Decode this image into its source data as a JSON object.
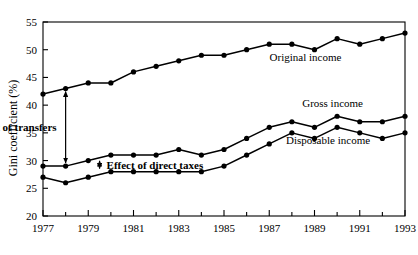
{
  "chart_data": {
    "type": "line",
    "title": "",
    "xlabel": "",
    "ylabel": "Gini coefficient (%)",
    "x": [
      1977,
      1978,
      1979,
      1980,
      1981,
      1982,
      1983,
      1984,
      1985,
      1986,
      1987,
      1988,
      1989,
      1990,
      1991,
      1992,
      1993
    ],
    "xlim": [
      1977,
      1993
    ],
    "ylim": [
      20,
      55
    ],
    "yticks": [
      20,
      25,
      30,
      35,
      40,
      45,
      50,
      55
    ],
    "xticks": [
      1977,
      1979,
      1981,
      1983,
      1985,
      1987,
      1989,
      1991,
      1993
    ],
    "xtick_labels": [
      "1977",
      "1979",
      "1981",
      "1983",
      "1985",
      "1987",
      "1989",
      "1991",
      "1993"
    ],
    "ytick_labels": [
      "20",
      "25",
      "30",
      "35",
      "40",
      "45",
      "50",
      "55"
    ],
    "grid": false,
    "legend_position": "inline-labels",
    "marker": "filled-circle",
    "line_color": "#000000",
    "series": [
      {
        "name": "Original income",
        "values": [
          42,
          43,
          44,
          44,
          46,
          47,
          48,
          49,
          49,
          50,
          51,
          51,
          50,
          52,
          51,
          52,
          53
        ]
      },
      {
        "name": "Gross income",
        "values": [
          29,
          29,
          30,
          31,
          31,
          31,
          32,
          31,
          32,
          34,
          36,
          37,
          36,
          38,
          37,
          37,
          38
        ]
      },
      {
        "name": "Disposable income",
        "values": [
          27,
          26,
          27,
          28,
          28,
          28,
          28,
          28,
          29,
          31,
          33,
          35,
          34,
          36,
          35,
          34,
          35
        ]
      }
    ],
    "annotations": [
      {
        "text": "Effect of transfers",
        "kind": "double-arrow",
        "at_x": 1978,
        "from_y": 43,
        "to_y": 29
      },
      {
        "text": "Effect of direct taxes",
        "kind": "double-arrow",
        "at_x": 1979.5,
        "from_y": 30.5,
        "to_y": 28
      }
    ],
    "series_labels": [
      {
        "text": "Original income",
        "x": 1988.6,
        "y": 47.9
      },
      {
        "text": "Gross income",
        "x": 1989.8,
        "y": 39.6
      },
      {
        "text": "Disposable income",
        "x": 1989.6,
        "y": 32.9
      }
    ]
  }
}
